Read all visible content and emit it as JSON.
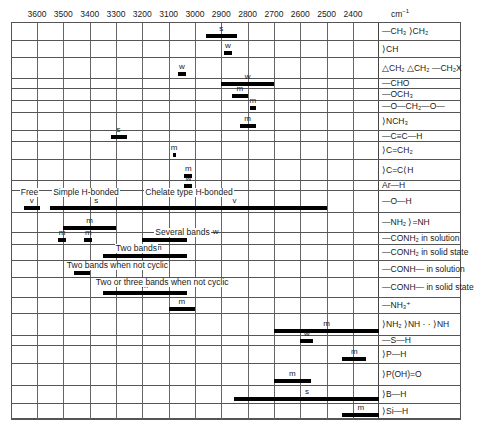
{
  "chart_data": {
    "type": "bar",
    "subtype": "range-bar (IR correlation chart)",
    "title": "",
    "xlabel": "cm-1",
    "x_axis_unit": "cm⁻¹",
    "x_ticks": [
      3600,
      3500,
      3400,
      3300,
      3200,
      3100,
      3000,
      2900,
      2800,
      2700,
      2600,
      2500,
      2400
    ],
    "xlim": [
      3700,
      2300
    ],
    "x_reversed": true,
    "grid": true,
    "intensity_legend": {
      "s": "strong",
      "m": "medium",
      "w": "weak",
      "v": "variable"
    },
    "rows": [
      {
        "label": "—CH₃  >CH₂",
        "bands": [
          {
            "from": 2960,
            "to": 2840,
            "intensity": "s"
          }
        ]
      },
      {
        "label": ">CH",
        "bands": [
          {
            "from": 2890,
            "to": 2860,
            "intensity": "w"
          }
        ]
      },
      {
        "label": "epoxide CH₂, cyclopropane CH₂, —CH₂X",
        "bands": [
          {
            "from": 3065,
            "to": 3035,
            "intensity": "w"
          }
        ]
      },
      {
        "label": "—CHO",
        "bands": [
          {
            "from": 2900,
            "to": 2700,
            "intensity": "w"
          }
        ]
      },
      {
        "label": "—OCH₃",
        "bands": [
          {
            "from": 2860,
            "to": 2800,
            "intensity": "m"
          }
        ]
      },
      {
        "label": "—O—CH₂—O—",
        "bands": [
          {
            "from": 2790,
            "to": 2770,
            "intensity": "m"
          }
        ]
      },
      {
        "label": ">NCH₃",
        "bands": [
          {
            "from": 2830,
            "to": 2770,
            "intensity": "m"
          }
        ]
      },
      {
        "label": "—C≡C—H",
        "bands": [
          {
            "from": 3320,
            "to": 3260,
            "intensity": "s"
          }
        ]
      },
      {
        "label": ">C=CH₂",
        "bands": [
          {
            "from": 3085,
            "to": 3075,
            "intensity": "m"
          }
        ]
      },
      {
        "label": ">C=C<H",
        "bands": [
          {
            "from": 3040,
            "to": 3010,
            "intensity": "m"
          }
        ]
      },
      {
        "label": "Ar—H",
        "bands": [
          {
            "from": 3040,
            "to": 3010,
            "intensity": "w"
          }
        ]
      },
      {
        "label": "—O—H",
        "bands": [
          {
            "from": 3650,
            "to": 3590,
            "intensity": "v",
            "note": "Free"
          },
          {
            "from": 3550,
            "to": 3200,
            "intensity": "s",
            "note": "Simple H-bonded"
          },
          {
            "from": 3200,
            "to": 2500,
            "intensity": "v",
            "note": "Chelate type H-bonded"
          }
        ]
      },
      {
        "label": "—NH₂  >C=NH",
        "bands": [
          {
            "from": 3500,
            "to": 3300,
            "intensity": "m"
          }
        ]
      },
      {
        "label": "—CONH₂ in solution",
        "bands": [
          {
            "from": 3520,
            "to": 3490,
            "intensity": "m"
          },
          {
            "from": 3420,
            "to": 3390,
            "intensity": "m"
          },
          {
            "from": 3200,
            "to": 3030,
            "intensity": "w",
            "note": "Several bands"
          }
        ]
      },
      {
        "label": "—CONH₂ in solid state",
        "bands": [
          {
            "from": 3350,
            "to": 3030,
            "intensity": "m",
            "note": "Two bands"
          }
        ]
      },
      {
        "label": "—CONH— in solution",
        "bands": [
          {
            "from": 3460,
            "to": 3400,
            "intensity": "m",
            "note": "Two bands when not cyclic"
          }
        ]
      },
      {
        "label": "—CONH— in solid state",
        "bands": [
          {
            "from": 3350,
            "to": 3030,
            "intensity": "m",
            "note": "Two or three bands when not cyclic"
          }
        ]
      },
      {
        "label": "—NH₃⁺",
        "bands": [
          {
            "from": 3100,
            "to": 3000,
            "intensity": "m"
          }
        ]
      },
      {
        "label": "amine salts: NH₂⁺ / NH⁺ / =NH⁺",
        "bands": [
          {
            "from": 2700,
            "to": 2300,
            "intensity": "m"
          }
        ]
      },
      {
        "label": "—S—H",
        "bands": [
          {
            "from": 2600,
            "to": 2550,
            "intensity": "w"
          }
        ]
      },
      {
        "label": ">P—H",
        "bands": [
          {
            "from": 2440,
            "to": 2350,
            "intensity": "m"
          }
        ]
      },
      {
        "label": ">P(=O)OH",
        "bands": [
          {
            "from": 2700,
            "to": 2560,
            "intensity": "m"
          }
        ]
      },
      {
        "label": ">B—H",
        "bands": [
          {
            "from": 2850,
            "to": 2300,
            "intensity": "s"
          }
        ]
      },
      {
        "label": ">Si—H",
        "bands": [
          {
            "from": 2440,
            "to": 2300,
            "intensity": "m"
          }
        ]
      }
    ]
  },
  "axis": {
    "unit_base": "cm",
    "unit_exp": "−1"
  },
  "notes": {
    "free": "Free",
    "simple_h_bonded": "Simple H-bonded",
    "chelate_h_bonded": "Chelate type H-bonded",
    "several_bands": "Several bands",
    "two_bands": "Two bands",
    "two_bands_not_cyclic": "Two bands when not cyclic",
    "two_or_three_bands": "Two or three bands when not cyclic"
  },
  "row_labels": [
    "—CH₃   ⟩CH₂",
    "⟩CH",
    "△CH₂  △CH₂  —CH₂X",
    "—CHO",
    "—OCH₃",
    "—O—CH₂—O—",
    "⟩NCH₃",
    "—C≡C—H",
    "⟩C=CH₂",
    "⟩C=C⟨H",
    "Ar—H",
    "—O—H",
    "—NH₂  ⟩=NH",
    "—CONH₂ in solution",
    "—CONH₂ in solid state",
    "—CONH— in solution",
    "—CONH— in solid state",
    "—NH₃⁺",
    "⟩NH₂  ⟩NH · · ⟩NH",
    "—S—H",
    "⟩P—H",
    "⟩P(OH)=O",
    "⟩B—H",
    "⟩Si—H"
  ]
}
